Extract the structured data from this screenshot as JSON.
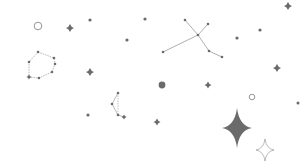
{
  "illustration": {
    "name": "starry-sky-constellations",
    "colors": {
      "background": "#ffffff",
      "star": "#6b6b6b",
      "line": "#9a9a9a",
      "outline": "#8a8a8a"
    },
    "dots": [
      {
        "x": 90,
        "y": 20,
        "r": 1.6
      },
      {
        "x": 127,
        "y": 40,
        "r": 1.6
      },
      {
        "x": 145,
        "y": 19,
        "r": 1.6
      },
      {
        "x": 237,
        "y": 38,
        "r": 1.6
      },
      {
        "x": 260,
        "y": 30,
        "r": 1.6
      },
      {
        "x": 298,
        "y": 103,
        "r": 1.5
      },
      {
        "x": 88,
        "y": 115,
        "r": 1.6
      },
      {
        "x": 162,
        "y": 85,
        "r": 3.4
      }
    ],
    "small_stars": [
      {
        "x": 70,
        "y": 28,
        "s": 4
      },
      {
        "x": 90,
        "y": 72,
        "s": 4
      },
      {
        "x": 288,
        "y": 6,
        "s": 4
      },
      {
        "x": 277,
        "y": 68,
        "s": 4
      },
      {
        "x": 208,
        "y": 85,
        "s": 3.5
      },
      {
        "x": 157,
        "y": 122,
        "s": 3.5
      }
    ],
    "outline_circles": [
      {
        "x": 38,
        "y": 26,
        "r": 3.8
      },
      {
        "x": 252,
        "y": 97,
        "r": 2.8
      }
    ],
    "constellations": [
      {
        "name": "polygon",
        "points": [
          [
            38,
            52
          ],
          [
            54,
            58
          ],
          [
            55,
            64
          ],
          [
            52,
            72
          ],
          [
            39,
            78
          ],
          [
            29,
            77
          ],
          [
            29,
            62
          ]
        ],
        "closed": true,
        "dashed": true
      },
      {
        "name": "cross",
        "segments": [
          [
            [
              185,
              20
            ],
            [
              198,
              35
            ]
          ],
          [
            [
              208,
              24
            ],
            [
              198,
              35
            ]
          ],
          [
            [
              198,
              35
            ],
            [
              163,
              52
            ]
          ],
          [
            [
              198,
              35
            ],
            [
              209,
              51
            ]
          ],
          [
            [
              209,
              51
            ],
            [
              222,
              57
            ]
          ]
        ],
        "points": [
          [
            185,
            20
          ],
          [
            208,
            24
          ],
          [
            198,
            35
          ],
          [
            163,
            52
          ],
          [
            209,
            51
          ],
          [
            222,
            57
          ]
        ]
      },
      {
        "name": "hook",
        "points": [
          [
            118,
            93
          ],
          [
            112,
            104
          ],
          [
            118,
            115
          ],
          [
            124,
            117
          ]
        ],
        "extra_segment": [
          [
            118,
            93
          ],
          [
            118,
            115
          ]
        ]
      }
    ],
    "big_star": {
      "x": 237,
      "y": 128,
      "w": 15,
      "h": 20
    },
    "outline_star": {
      "x": 265,
      "y": 150,
      "w": 9,
      "h": 11
    }
  }
}
